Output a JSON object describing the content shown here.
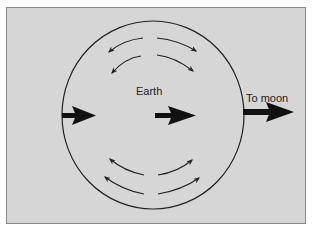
{
  "diagram": {
    "labels": {
      "earth": "Earth",
      "moon": "To moon"
    },
    "colors": {
      "background": "#d6d6d6",
      "frame": "#8a8a8a",
      "stroke": "#222222",
      "arrow": "#111111"
    },
    "elements": [
      {
        "type": "ellipse",
        "name": "earth-outline",
        "cx": 153,
        "cy": 115,
        "rx": 91,
        "ry": 94
      },
      {
        "type": "bold-arrow",
        "name": "left-force-arrow",
        "direction": "right"
      },
      {
        "type": "bold-arrow",
        "name": "center-force-arrow",
        "direction": "right"
      },
      {
        "type": "bold-arrow",
        "name": "to-moon-arrow",
        "direction": "right"
      },
      {
        "type": "curved-arrow-group",
        "name": "top-flow-arrows",
        "count": 4
      },
      {
        "type": "curved-arrow-group",
        "name": "bottom-flow-arrows",
        "count": 4
      }
    ]
  }
}
